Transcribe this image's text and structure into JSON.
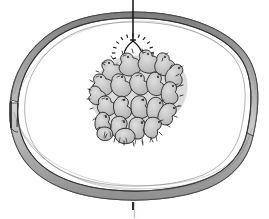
{
  "figure": {
    "caption_mark": "|",
    "domain_kind": "line-drawing-illustration",
    "background_color": "#ffffff",
    "ink_color": "#1a1a1a",
    "shade_color": "#8d8d8d",
    "light_shade_color": "#c9c9c9",
    "mid_shade_color": "#a8a8a8"
  },
  "scene": {
    "ring": {
      "label": "chick guard ring",
      "outer_stroke": "#3a3a3a",
      "band_fill": "#9a9a9a",
      "inner_fill": "#ffffff",
      "seam_label": "ring overlap seam",
      "seam_position": "left"
    },
    "lamp": {
      "label": "hanging heat lamp",
      "cord_label": "suspension cord",
      "bulb_label": "bulb",
      "ray_count": 20,
      "ray_label": "radiating heat rays",
      "cord_color": "#111111",
      "bulb_stroke": "#151515"
    },
    "chicks": {
      "label": "huddle of chicks",
      "count_visible": 22,
      "body_fill": "#c2c2c2",
      "outline": "#1c1c1c"
    },
    "floor": {
      "label": "brooder floor",
      "fill": "#ffffff"
    }
  }
}
